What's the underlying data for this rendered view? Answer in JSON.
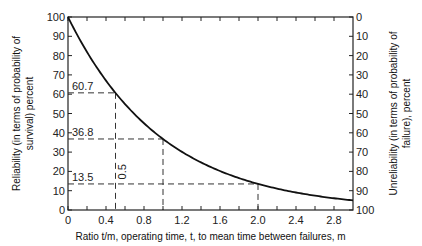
{
  "chart_data": {
    "type": "line",
    "title": "",
    "xlabel": "Ratio t/m, operating time, t, to mean time between failures, m",
    "ylabel_left": [
      "Reliability (in terms of probability of",
      "survival) percent"
    ],
    "ylabel_right": [
      "Unreliability (in terms of probability of",
      "failure), percent"
    ],
    "xlim": [
      0,
      3.0
    ],
    "ylim": [
      0,
      100
    ],
    "x_ticks": [
      0,
      0.4,
      0.8,
      1.2,
      1.6,
      2.0,
      2.4,
      2.8
    ],
    "x_tick_labels": [
      "0",
      "0.4",
      "0.8",
      "1.2",
      "1.6",
      "2.0",
      "2.4",
      "2.8"
    ],
    "x_minor_ticks": [
      0.2,
      0.6,
      1.0,
      1.4,
      1.8,
      2.2,
      2.6
    ],
    "y_left_ticks": [
      0,
      10,
      20,
      30,
      40,
      50,
      60,
      70,
      80,
      90,
      100
    ],
    "y_left_tick_labels": [
      "0",
      "10",
      "20",
      "30",
      "40",
      "50",
      "60",
      "70",
      "80",
      "90",
      "100"
    ],
    "y_right_tick_labels": [
      "100",
      "90",
      "80",
      "70",
      "60",
      "50",
      "40",
      "30",
      "20",
      "10",
      "0"
    ],
    "grid": false,
    "series": [
      {
        "name": "Reliability R = e^(-t/m)",
        "x": [
          0,
          0.1,
          0.2,
          0.3,
          0.4,
          0.5,
          0.6,
          0.7,
          0.8,
          0.9,
          1.0,
          1.2,
          1.4,
          1.6,
          1.8,
          2.0,
          2.2,
          2.4,
          2.6,
          2.8,
          3.0
        ],
        "values": [
          100,
          90.5,
          81.9,
          74.1,
          67.0,
          60.7,
          54.9,
          49.7,
          44.9,
          40.7,
          36.8,
          30.1,
          24.7,
          20.2,
          16.5,
          13.5,
          11.1,
          9.1,
          7.4,
          6.1,
          5.0
        ]
      }
    ],
    "reference_points": [
      {
        "x": 0.5,
        "y": 60.7,
        "label": "60.7"
      },
      {
        "x": 1.0,
        "y": 36.8,
        "label": "36.8"
      },
      {
        "x": 2.0,
        "y": 13.5,
        "label": "13.5"
      }
    ],
    "annotations": [
      {
        "text": "0.5",
        "x": 0.5,
        "y": 20,
        "rotated": true
      }
    ]
  }
}
